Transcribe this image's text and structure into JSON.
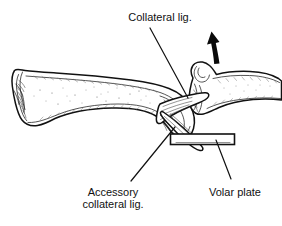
{
  "figure": {
    "background_color": "#ffffff",
    "ink_color": "#111111",
    "width": 282,
    "height": 226
  },
  "labels": {
    "collateral_ligament": "Collateral lig.",
    "accessory_line1": "Accessory",
    "accessory_line2": "collateral lig.",
    "volar_plate": "Volar plate"
  },
  "annotations": {
    "arrow": {
      "name": "displacement-arrow",
      "direction": "up",
      "color": "#0a0a0a"
    },
    "leaders": [
      {
        "name": "collateral-lig-leader",
        "from_x": 150,
        "from_y": 28,
        "to_x": 188,
        "to_y": 98
      },
      {
        "name": "accessory-collateral-lig-leader",
        "from_x": 131,
        "from_y": 181,
        "to_x": 175,
        "to_y": 127
      },
      {
        "name": "volar-plate-leader",
        "from_x": 216,
        "from_y": 140,
        "to_x": 231,
        "to_y": 179
      }
    ]
  },
  "structures": {
    "proximal_phalanx": "proximal-phalanx",
    "middle_phalanx": "middle-phalanx",
    "collateral_ligament_band": "collateral-ligament-band",
    "accessory_collateral_band": "accessory-collateral-ligament-band",
    "volar_plate_marker": "volar-plate-marker"
  }
}
